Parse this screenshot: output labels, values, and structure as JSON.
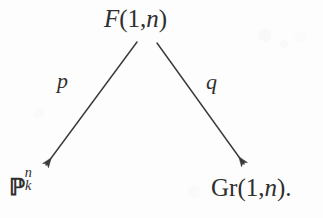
{
  "figure": {
    "kind": "commutative-diagram",
    "background_color": "#fdfdfd",
    "ink_color": "#2f2f2f",
    "stroke_color": "#3a3a3a"
  },
  "nodes": {
    "apex": {
      "id": "apex",
      "text": "F(1, n)",
      "letter": "F",
      "open_paren": "(",
      "first_arg": "1",
      "comma": ",",
      "second_arg": "n",
      "close_paren": ")"
    },
    "source": {
      "id": "projective-space",
      "text": "P^n_k",
      "symbol": "ℙ",
      "superscript": "n",
      "subscript": "k"
    },
    "target": {
      "id": "grassmannian",
      "text": "Gr(1, n).",
      "name": "Gr",
      "open_paren": "(",
      "first_arg": "1",
      "comma": ",",
      "second_arg": "n",
      "close_paren": ")",
      "period": "."
    }
  },
  "arrows": [
    {
      "id": "arrow-left",
      "label": "p",
      "from": "apex",
      "to": "projective-space",
      "x1": 137,
      "y1": 42,
      "x2": 46,
      "y2": 165,
      "direction": "down-left"
    },
    {
      "id": "arrow-right",
      "label": "q",
      "from": "apex",
      "to": "grassmannian",
      "x1": 157,
      "y1": 43,
      "x2": 244,
      "y2": 164,
      "direction": "down-right"
    }
  ]
}
